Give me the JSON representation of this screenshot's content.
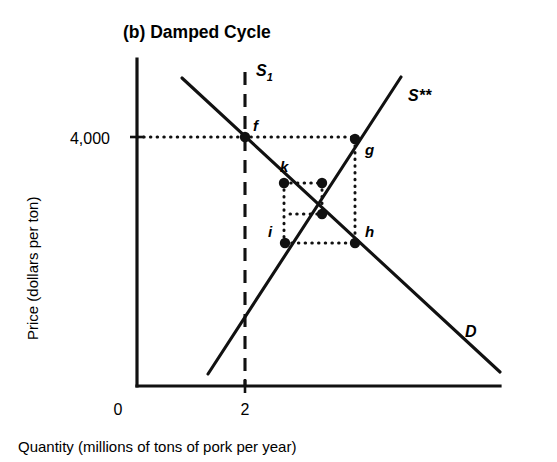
{
  "figure": {
    "title": "(b) Damped Cycle",
    "y_axis_title": "Price (dollars per ton)",
    "x_axis_title": "Quantity (millions of tons of pork per year)",
    "origin_label": "0",
    "y_tick_label": "4,000",
    "x_tick_label": "2",
    "ink_color": "#111111",
    "background_color": "#ffffff"
  },
  "curves": {
    "demand": {
      "label": "D",
      "label_x": 465,
      "label_y": 337,
      "x1": 182,
      "y1": 78,
      "x2": 500,
      "y2": 372
    },
    "supply_star": {
      "label": "S**",
      "label_x": 408,
      "label_y": 101,
      "x1": 208,
      "y1": 374,
      "x2": 401,
      "y2": 77
    },
    "supply_fixed": {
      "label": "S",
      "label_sub": "1",
      "label_x": 256,
      "label_y": 76,
      "x": 245,
      "y1": 72,
      "y2": 386
    }
  },
  "axes": {
    "y_axis_x": 137,
    "y_axis_top": 59,
    "x_axis_y": 386,
    "x_axis_right": 500,
    "y_tick_y": 137,
    "x_tick_x": 245,
    "y_tick_label_x": 110,
    "x_tick_label_y": 409,
    "origin_label_x": 118,
    "origin_label_y": 409
  },
  "chart_data": {
    "type": "line",
    "title": "(b) Damped Cycle",
    "xlabel": "Quantity (millions of tons of pork per year)",
    "ylabel": "Price (dollars per ton)",
    "xticks": [
      0,
      2
    ],
    "xtick_labels": [
      "0",
      "2"
    ],
    "yticks": [
      4000
    ],
    "ytick_labels": [
      "4,000"
    ],
    "grid": false,
    "legend": "inline curve labels",
    "series": [
      {
        "name": "D",
        "type": "demand curve",
        "description": "downward-sloping demand line",
        "points_px": [
          [
            182,
            78
          ],
          [
            500,
            372
          ]
        ]
      },
      {
        "name": "S**",
        "type": "supply curve",
        "description": "upward-sloping long-run supply line",
        "points_px": [
          [
            208,
            374
          ],
          [
            401,
            77
          ]
        ]
      },
      {
        "name": "S1",
        "type": "vertical short-run supply",
        "description": "dashed vertical line at quantity 2",
        "points_px": [
          [
            245,
            72
          ],
          [
            245,
            386
          ]
        ]
      }
    ],
    "labeled_points": [
      {
        "label": "f",
        "x_px": 245,
        "y_px": 137,
        "price": 4000,
        "quantity": 2,
        "on": "D and S1",
        "label_dx": 8,
        "label_dy": -6
      },
      {
        "label": "g",
        "x_px": 355,
        "y_px": 139,
        "price": 4000,
        "on": "S**",
        "label_dx": 10,
        "label_dy": 16
      },
      {
        "label": "k",
        "x_px": 284,
        "y_px": 183,
        "on": "D",
        "label_dx": -4,
        "label_dy": -11
      },
      {
        "label": "h",
        "x_px": 355,
        "y_px": 243,
        "on": "D",
        "label_dx": 10,
        "label_dy": -6
      },
      {
        "label": "i",
        "x_px": 285,
        "y_px": 243,
        "on": "S**",
        "label_dx": -17,
        "label_dy": -6
      }
    ],
    "unlabeled_points": [
      {
        "x_px": 322,
        "y_px": 183,
        "on": "S**"
      },
      {
        "x_px": 322,
        "y_px": 214,
        "on": "D"
      }
    ],
    "cobweb_guides": [
      {
        "from": [
          137,
          137
        ],
        "to": [
          355,
          137
        ],
        "orientation": "horizontal",
        "note": "price 4,000 line from axis through f to g"
      },
      {
        "from": [
          355,
          139
        ],
        "to": [
          355,
          243
        ],
        "orientation": "vertical",
        "note": "g down to h"
      },
      {
        "from": [
          285,
          243
        ],
        "to": [
          355,
          243
        ],
        "orientation": "horizontal",
        "note": "h back to i"
      },
      {
        "from": [
          284,
          183
        ],
        "to": [
          284,
          243
        ],
        "orientation": "vertical",
        "note": "i up to k"
      },
      {
        "from": [
          284,
          183
        ],
        "to": [
          322,
          183
        ],
        "orientation": "horizontal",
        "note": "k across to supply"
      },
      {
        "from": [
          322,
          183
        ],
        "to": [
          322,
          214
        ],
        "orientation": "vertical",
        "note": "inner step down"
      },
      {
        "from": [
          290,
          214
        ],
        "to": [
          322,
          214
        ],
        "orientation": "horizontal",
        "note": "inner step across"
      }
    ],
    "annotation": "Cobweb (damped) adjustment: price converges toward equilibrium through the sequence f, g, h, i, k and inward."
  }
}
